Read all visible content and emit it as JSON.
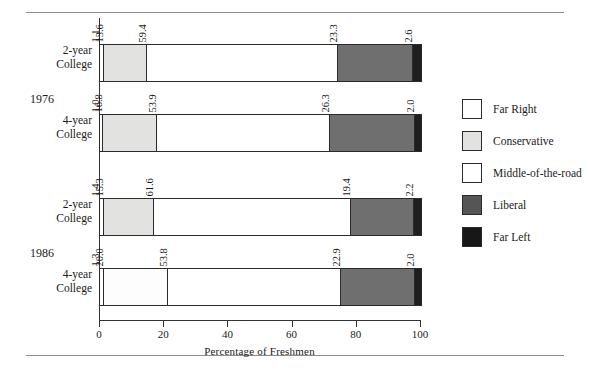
{
  "chart_data": {
    "type": "bar",
    "orientation": "horizontal",
    "stacked": true,
    "title": "",
    "xlabel": "Percentage of Freshmen",
    "ylabel": "",
    "xlim": [
      0,
      100
    ],
    "xticks": [
      "0",
      "20",
      "40",
      "60",
      "80",
      "100"
    ],
    "grid": false,
    "legend_position": "right",
    "categories": [
      "2-year College",
      "4-year College",
      "2-year College",
      "4-year College"
    ],
    "groups": [
      "1976",
      "1986"
    ],
    "series": [
      {
        "name": "Far Right",
        "values": [
          1.1,
          1.0,
          1.4,
          1.3
        ],
        "color": "#ffffff"
      },
      {
        "name": "Conservative",
        "values": [
          13.6,
          16.8,
          15.3,
          20.0
        ],
        "color": "#e2e2e0"
      },
      {
        "name": "Middle-of-the-road",
        "values": [
          59.4,
          53.9,
          61.6,
          53.8
        ],
        "color": "#ffffff"
      },
      {
        "name": "Liberal",
        "values": [
          23.3,
          26.3,
          19.4,
          22.9
        ],
        "color": "#6f6f6f"
      },
      {
        "name": "Far Left",
        "values": [
          2.6,
          2.0,
          2.2,
          2.0
        ],
        "color": "#1e1e1e"
      }
    ],
    "bars": [
      {
        "group": "1976",
        "category": "2-year College",
        "segments": [
          {
            "name": "Far Right",
            "value": 1.1,
            "label": "1.1"
          },
          {
            "name": "Conservative",
            "value": 13.6,
            "label": "13.6"
          },
          {
            "name": "Middle-of-the-road",
            "value": 59.4,
            "label": "59.4"
          },
          {
            "name": "Liberal",
            "value": 23.3,
            "label": "23.3"
          },
          {
            "name": "Far Left",
            "value": 2.6,
            "label": "2.6"
          }
        ]
      },
      {
        "group": "1976",
        "category": "4-year College",
        "segments": [
          {
            "name": "Far Right",
            "value": 1.0,
            "label": "1.0"
          },
          {
            "name": "Conservative",
            "value": 16.8,
            "label": "16.8"
          },
          {
            "name": "Middle-of-the-road",
            "value": 53.9,
            "label": "53.9"
          },
          {
            "name": "Liberal",
            "value": 26.3,
            "label": "26.3"
          },
          {
            "name": "Far Left",
            "value": 2.0,
            "label": "2.0"
          }
        ]
      },
      {
        "group": "1986",
        "category": "2-year College",
        "segments": [
          {
            "name": "Far Right",
            "value": 1.4,
            "label": "1.4"
          },
          {
            "name": "Conservative",
            "value": 15.3,
            "label": "15.3"
          },
          {
            "name": "Middle-of-the-road",
            "value": 61.6,
            "label": "61.6"
          },
          {
            "name": "Liberal",
            "value": 19.4,
            "label": "19.4"
          },
          {
            "name": "Far Left",
            "value": 2.2,
            "label": "2.2"
          }
        ]
      },
      {
        "group": "1986",
        "category": "4-year College",
        "segments": [
          {
            "name": "Far Right",
            "value": 1.3,
            "label": "1.3"
          },
          {
            "name": "Conservative",
            "value": 20.0,
            "label": "20.0"
          },
          {
            "name": "Middle-of-the-road",
            "value": 53.8,
            "label": "53.8"
          },
          {
            "name": "Liberal",
            "value": 22.9,
            "label": "22.9"
          },
          {
            "name": "Far Left",
            "value": 2.0,
            "label": "2.0"
          }
        ]
      }
    ],
    "legend": [
      {
        "label": "Far Right",
        "swatch": "far-right"
      },
      {
        "label": "Conservative",
        "swatch": "conservative"
      },
      {
        "label": "Middle-of-the-road",
        "swatch": "middle"
      },
      {
        "label": "Liberal",
        "swatch": "liberal"
      },
      {
        "label": "Far Left",
        "swatch": "far-left"
      }
    ]
  },
  "axis": {
    "x_title": "Percentage of Freshmen",
    "ticks": [
      {
        "label": "0",
        "value": 0
      },
      {
        "label": "20",
        "value": 20
      },
      {
        "label": "40",
        "value": 40
      },
      {
        "label": "60",
        "value": 60
      },
      {
        "label": "80",
        "value": 80
      },
      {
        "label": "100",
        "value": 100
      }
    ]
  },
  "row_labels": [
    {
      "line1": "2-year",
      "line2": "College"
    },
    {
      "line1": "4-year",
      "line2": "College"
    },
    {
      "line1": "2-year",
      "line2": "College"
    },
    {
      "line1": "4-year",
      "line2": "College"
    }
  ],
  "group_labels": [
    {
      "text": "1976"
    },
    {
      "text": "1986"
    }
  ]
}
